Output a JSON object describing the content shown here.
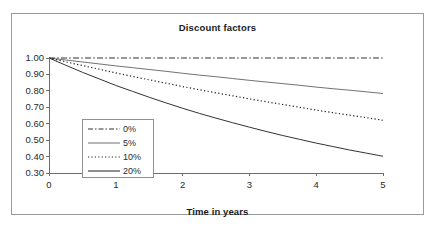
{
  "chart_data": {
    "type": "line",
    "title": "Discount factors",
    "xlabel": "Time in years",
    "ylabel": "",
    "xlim": [
      0,
      5
    ],
    "ylim": [
      0.3,
      1.0
    ],
    "grid": false,
    "legend_position": "inside-left",
    "x_ticks": [
      "0",
      "1",
      "2",
      "3",
      "4",
      "5"
    ],
    "y_ticks": [
      "1.00",
      "0.90",
      "0.80",
      "0.70",
      "0.60",
      "0.50",
      "0.40",
      "0.30"
    ],
    "x": [
      0,
      0.25,
      0.5,
      0.75,
      1,
      1.25,
      1.5,
      1.75,
      2,
      2.25,
      2.5,
      2.75,
      3,
      3.25,
      3.5,
      3.75,
      4,
      4.25,
      4.5,
      4.75,
      5
    ],
    "series": [
      {
        "name": "0%",
        "style": "dash-dot",
        "color": "#333333",
        "width": 1.0,
        "values": [
          1.0,
          1.0,
          1.0,
          1.0,
          1.0,
          1.0,
          1.0,
          1.0,
          1.0,
          1.0,
          1.0,
          1.0,
          1.0,
          1.0,
          1.0,
          1.0,
          1.0,
          1.0,
          1.0,
          1.0,
          1.0
        ]
      },
      {
        "name": "5%",
        "style": "solid-thin",
        "color": "#4d4d4d",
        "width": 0.8,
        "values": [
          1.0,
          0.988,
          0.976,
          0.964,
          0.952,
          0.941,
          0.93,
          0.919,
          0.907,
          0.896,
          0.886,
          0.875,
          0.864,
          0.854,
          0.844,
          0.834,
          0.823,
          0.813,
          0.804,
          0.794,
          0.784
        ]
      },
      {
        "name": "10%",
        "style": "dotted",
        "color": "#2a2a2a",
        "width": 1.2,
        "values": [
          1.0,
          0.977,
          0.954,
          0.932,
          0.909,
          0.888,
          0.867,
          0.847,
          0.826,
          0.807,
          0.788,
          0.77,
          0.751,
          0.734,
          0.717,
          0.7,
          0.683,
          0.667,
          0.652,
          0.637,
          0.621
        ]
      },
      {
        "name": "20%",
        "style": "solid",
        "color": "#333333",
        "width": 1.0,
        "values": [
          1.0,
          0.956,
          0.913,
          0.873,
          0.833,
          0.797,
          0.761,
          0.727,
          0.694,
          0.663,
          0.634,
          0.606,
          0.579,
          0.553,
          0.528,
          0.505,
          0.482,
          0.461,
          0.44,
          0.421,
          0.402
        ]
      }
    ]
  },
  "legend": {
    "items": [
      {
        "label": "0%"
      },
      {
        "label": "5%"
      },
      {
        "label": "10%"
      },
      {
        "label": "20%"
      }
    ]
  }
}
